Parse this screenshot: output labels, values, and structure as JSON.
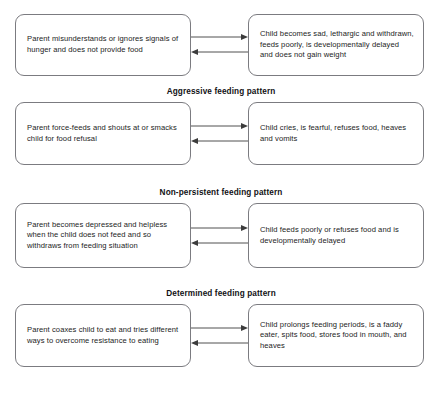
{
  "diagram": {
    "box_border_color": "#7b7b80",
    "text_color": "#1c1c1c",
    "background_color": "#ffffff",
    "arrow_color": "#3c3c3c",
    "sections": [
      {
        "heading": null,
        "parent_box": "Parent misunderstands or ignores signals of hunger and does not provide food",
        "child_box": "Child becomes sad, lethargic and withdrawn, feeds poorly, is developmentally delayed and does not gain weight"
      },
      {
        "heading": "Aggressive feeding pattern",
        "parent_box": "Parent force-feeds and shouts at or smacks child for food refusal",
        "child_box": "Child cries, is fearful, refuses food, heaves and vomits"
      },
      {
        "heading": "Non-persistent feeding pattern",
        "parent_box": "Parent becomes depressed and helpless when the child does not feed and so withdraws from feeding situation",
        "child_box": "Child feeds poorly or refuses food and is developmentally delayed"
      },
      {
        "heading": "Determined feeding pattern",
        "parent_box": "Parent coaxes child to eat and tries different ways to overcome resistance to eating",
        "child_box": "Child prolongs feeding periods, is a faddy eater, spits food, stores food in mouth, and heaves"
      }
    ],
    "headings_between": [
      "Aggressive feeding pattern",
      "Non-persistent feeding pattern",
      "Determined feeding pattern"
    ],
    "arrows": {
      "forward_label": "parent-to-child",
      "reverse_label": "child-to-parent"
    }
  }
}
